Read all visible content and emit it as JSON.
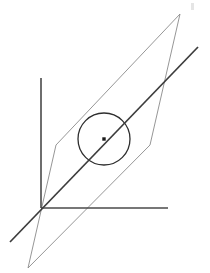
{
  "figure": {
    "name": "line-intersecting-plane-and-circle",
    "background_color": "#ffffff",
    "width": 210,
    "height": 273
  },
  "style": {
    "axis_color": "#4a4a4a",
    "axis_width": 1.6,
    "diagonal_color": "#3c3c3c",
    "diagonal_width": 1.7,
    "plane_color": "#8a8a8a",
    "plane_width": 0.9,
    "circle_color": "#2e2e2e",
    "circle_width": 1.3,
    "point_color": "#1a1a1a",
    "artifact_color": "#cfcfcf"
  },
  "geometry": {
    "origin": {
      "label": "origin",
      "x": 41,
      "y": 208
    },
    "axes": [
      {
        "label": "vertical-axis",
        "x1": 41,
        "y1": 78,
        "x2": 41,
        "y2": 208
      },
      {
        "label": "horizontal-axis",
        "x1": 41,
        "y1": 208,
        "x2": 168,
        "y2": 208
      }
    ],
    "diagonal_line": {
      "label": "oblique-line",
      "x1": 10,
      "y1": 242,
      "x2": 198,
      "y2": 47
    },
    "plane": {
      "label": "parallelogram-plane",
      "points": "180,14 150,145 28,268 56,145"
    },
    "circle": {
      "label": "circle-in-plane",
      "cx": 104,
      "cy": 139,
      "r": 26
    },
    "center_point": {
      "label": "circle-center-point",
      "cx": 104,
      "cy": 139,
      "size": 3.4
    },
    "artifact": {
      "label": "scan-artifact",
      "x": 191,
      "y": 3,
      "w": 3,
      "h": 7
    }
  }
}
